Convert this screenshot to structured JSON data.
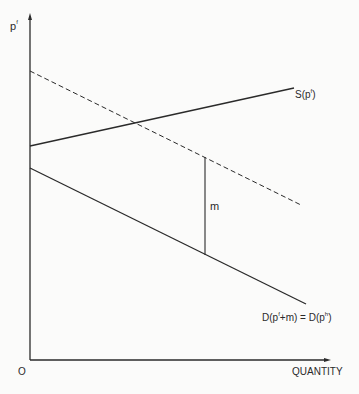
{
  "axes": {
    "y_label": "p",
    "y_label_sup": "f",
    "x_label": "QUANTITY",
    "origin_label": "O"
  },
  "curves": {
    "supply": {
      "label": "S(p",
      "sup": "f",
      "close": ")"
    },
    "demand": {
      "label_a": "D(p",
      "sup_a": "f",
      "mid": "+m) = D(p",
      "sup_b": "h",
      "close": ")"
    },
    "shifted_demand": {
      "style": "dashed"
    }
  },
  "markers": {
    "wedge_label": "m"
  },
  "colors": {
    "ink": "#2a2a2a",
    "background": "#fbfbfa"
  }
}
